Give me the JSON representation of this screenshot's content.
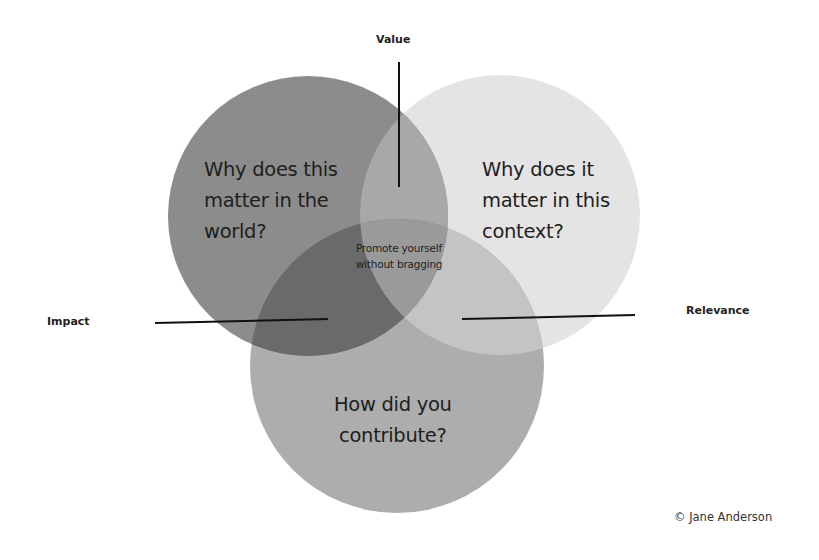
{
  "diagram": {
    "type": "venn",
    "circle_count": 3,
    "circles": [
      {
        "id": "world",
        "lines": [
          "Why does this",
          "matter in the",
          "world?"
        ],
        "color": "#8c8c8c"
      },
      {
        "id": "context",
        "lines": [
          "Why does it",
          "matter in this",
          "context?"
        ],
        "color": "#e4e4e4"
      },
      {
        "id": "contribution",
        "lines": [
          "How did you",
          "contribute?"
        ],
        "color": "#adadad"
      }
    ],
    "center": {
      "lines": [
        "Promote yourself",
        "without bragging"
      ]
    },
    "overlap_labels": {
      "value": "Value",
      "impact": "Impact",
      "relevance": "Relevance"
    },
    "region_colors": {
      "world_context": "#a8a8a8",
      "world_contribution": "#6a6a6a",
      "context_contribution": "#c4c4c4",
      "all_three": "#9a9a9a"
    },
    "credit": "© Jane Anderson"
  }
}
